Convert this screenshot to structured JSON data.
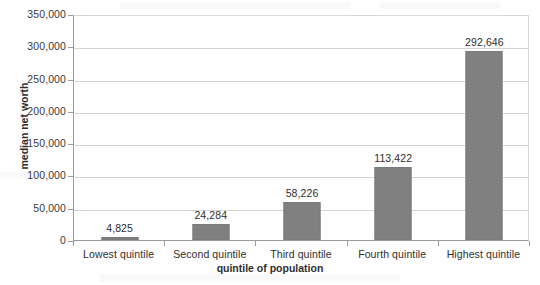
{
  "chart_data": {
    "type": "bar",
    "title": "",
    "subtitle": "",
    "xlabel": "quintile of population",
    "ylabel": "median net worth",
    "categories": [
      "Lowest quintile",
      "Second quintile",
      "Third quintile",
      "Fourth quintile",
      "Highest quintile"
    ],
    "values": [
      4825,
      24284,
      58226,
      113422,
      292646
    ],
    "value_labels": [
      "4,825",
      "24,284",
      "58,226",
      "113,422",
      "292,646"
    ],
    "series": [
      {
        "name": "median net worth",
        "values": [
          4825,
          24284,
          58226,
          113422,
          292646
        ],
        "color": "#808080"
      }
    ],
    "ylim": [
      0,
      350000
    ],
    "ytick_values": [
      0,
      50000,
      100000,
      150000,
      200000,
      250000,
      300000,
      350000
    ],
    "ytick_labels": [
      "0",
      "50,000",
      "100,000",
      "150,000",
      "200,000",
      "250,000",
      "300,000",
      "350,000"
    ],
    "grid": true,
    "grid_axis": "y",
    "legend": false,
    "legend_position": "none",
    "data_labels": true,
    "bar_color": "#808080",
    "gridline_color": "#d4d4d4",
    "axis_color": "#9a9a9a",
    "background_color": "#ffffff"
  }
}
